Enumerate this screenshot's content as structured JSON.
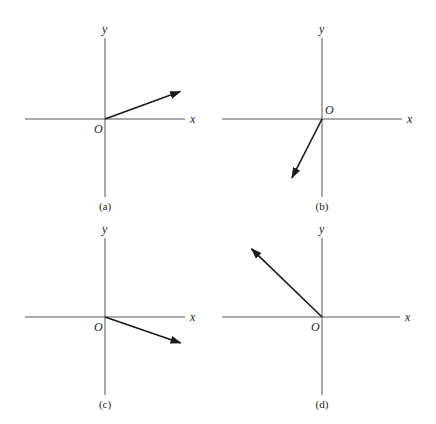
{
  "figure": {
    "axis_labels": {
      "x": "x",
      "y": "y",
      "origin": "O"
    },
    "panels": [
      {
        "id": "a",
        "caption": "(a)",
        "vector_direction_deg": 20,
        "quadrant": "I",
        "origin_label_side": "below-left"
      },
      {
        "id": "b",
        "caption": "(b)",
        "vector_direction_deg": 243,
        "quadrant": "III",
        "origin_label_side": "above-right"
      },
      {
        "id": "c",
        "caption": "(c)",
        "vector_direction_deg": -19,
        "quadrant": "IV",
        "origin_label_side": "below-left"
      },
      {
        "id": "d",
        "caption": "(d)",
        "vector_direction_deg": 136,
        "quadrant": "II",
        "origin_label_side": "below-left"
      }
    ]
  }
}
